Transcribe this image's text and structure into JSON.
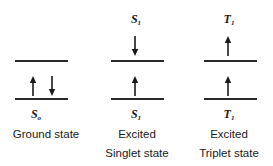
{
  "diagram": {
    "type": "electron-spin-state-diagram",
    "columns": [
      {
        "id": "ground",
        "top_symbol": null,
        "bottom_symbol": {
          "letter": "S",
          "subscript": "o"
        },
        "caption_line1": "Ground state",
        "caption_line2": "",
        "upper_level_arrows": [],
        "lower_level_arrows": [
          "up",
          "down"
        ]
      },
      {
        "id": "excited-singlet",
        "top_symbol": {
          "letter": "S",
          "subscript": "1"
        },
        "bottom_symbol": {
          "letter": "S",
          "subscript": "1"
        },
        "caption_line1": "Excited",
        "caption_line2": "Singlet state",
        "upper_level_arrows": [
          "down"
        ],
        "lower_level_arrows": [
          "up"
        ]
      },
      {
        "id": "excited-triplet",
        "top_symbol": {
          "letter": "T",
          "subscript": "1"
        },
        "bottom_symbol": {
          "letter": "T",
          "subscript": "1"
        },
        "caption_line1": "Excited",
        "caption_line2": "Triplet state",
        "upper_level_arrows": [
          "up"
        ],
        "lower_level_arrows": [
          "up"
        ]
      }
    ],
    "line_color": "#2a2a2a",
    "arrow_color": "#1a1a1a"
  }
}
